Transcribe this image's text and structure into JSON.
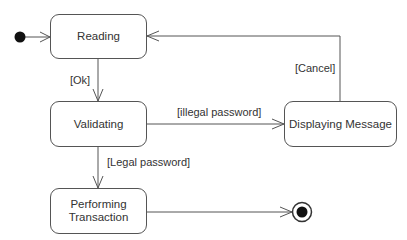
{
  "diagram": {
    "type": "uml-state-machine",
    "states": [
      {
        "id": "reading",
        "label": "Reading"
      },
      {
        "id": "validating",
        "label": "Validating"
      },
      {
        "id": "displaying",
        "label": "Displaying Message"
      },
      {
        "id": "performing",
        "label_line1": "Performing",
        "label_line2": "Transaction"
      }
    ],
    "transitions": [
      {
        "from": "initial",
        "to": "reading",
        "guard": ""
      },
      {
        "from": "reading",
        "to": "validating",
        "guard": "[Ok]"
      },
      {
        "from": "validating",
        "to": "displaying",
        "guard": "[illegal password]"
      },
      {
        "from": "displaying",
        "to": "reading",
        "guard": "[Cancel]"
      },
      {
        "from": "validating",
        "to": "performing",
        "guard": "[Legal password]"
      },
      {
        "from": "performing",
        "to": "final",
        "guard": ""
      }
    ],
    "colors": {
      "line": "#555555",
      "text": "#333333",
      "node_fill": "#111111"
    }
  }
}
